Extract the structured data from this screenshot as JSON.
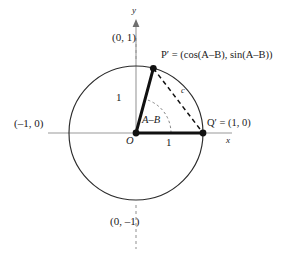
{
  "figure": {
    "background": "#ffffff",
    "ink": "#1a1a1a",
    "axis_color": "#9a9a9a"
  },
  "axes": {
    "x_label": "x",
    "y_label": "y"
  },
  "labels": {
    "top_point": "(0, 1)",
    "bottom_point": "(0, –1)",
    "left_point": "(–1, 0)",
    "right_point": "Q′ = (1, 0)",
    "p_prime": "P′ = (cos(A–B), sin(A–B))",
    "origin": "O",
    "radius_vertical": "1",
    "radius_horizontal": "1",
    "angle": "A–B",
    "chord": "c"
  },
  "geometry": {
    "center_x": 136,
    "center_y": 133,
    "radius": 67,
    "p_prime_angle_deg": 75,
    "q_prime_angle_deg": 0,
    "arc_radius": 35,
    "circle_stroke": "#2b2b2b",
    "radius_stroke": "#111111",
    "chord_stroke": "#111111"
  }
}
